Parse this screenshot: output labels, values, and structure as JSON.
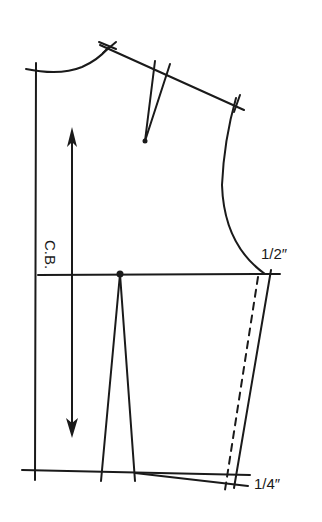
{
  "diagram": {
    "type": "sewing-pattern-bodice-back",
    "stroke_color": "#1a1a1a",
    "background_color": "#ffffff",
    "labels": {
      "center_back": "C.B.",
      "side_chest_adjustment": "1/2″",
      "side_waist_adjustment": "1/4″"
    },
    "elements": [
      "center-back-line",
      "back-neckline-curve",
      "shoulder-line",
      "shoulder-dart",
      "armhole-curve",
      "grainline-arrow",
      "chest-line",
      "waist-dart",
      "side-seam-new",
      "side-seam-original-dashed",
      "waistline",
      "waistline-adjusted"
    ]
  }
}
